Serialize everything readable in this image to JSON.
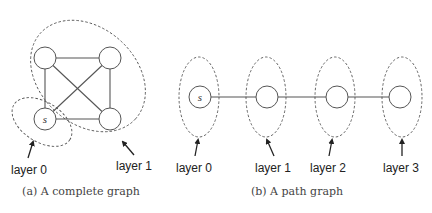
{
  "figures": [
    {
      "id": "a",
      "caption": "(a) A complete graph",
      "type": "complete graph",
      "nodes": [
        {
          "id": "tl",
          "label": ""
        },
        {
          "id": "tr",
          "label": ""
        },
        {
          "id": "bl",
          "label": "s"
        },
        {
          "id": "br",
          "label": ""
        }
      ],
      "edges": [
        [
          "tl",
          "tr"
        ],
        [
          "tl",
          "bl"
        ],
        [
          "tl",
          "br"
        ],
        [
          "tr",
          "bl"
        ],
        [
          "tr",
          "br"
        ],
        [
          "bl",
          "br"
        ]
      ],
      "layers": [
        {
          "label": "layer 0",
          "nodes": [
            "bl"
          ]
        },
        {
          "label": "layer 1",
          "nodes": [
            "tl",
            "tr",
            "br"
          ]
        }
      ]
    },
    {
      "id": "b",
      "caption": "(b) A path graph",
      "type": "path graph",
      "nodes": [
        {
          "id": "n0",
          "label": "s"
        },
        {
          "id": "n1",
          "label": ""
        },
        {
          "id": "n2",
          "label": ""
        },
        {
          "id": "n3",
          "label": ""
        }
      ],
      "edges": [
        [
          "n0",
          "n1"
        ],
        [
          "n1",
          "n2"
        ],
        [
          "n2",
          "n3"
        ]
      ],
      "layers": [
        {
          "label": "layer 0",
          "nodes": [
            "n0"
          ]
        },
        {
          "label": "layer 1",
          "nodes": [
            "n1"
          ]
        },
        {
          "label": "layer 2",
          "nodes": [
            "n2"
          ]
        },
        {
          "label": "layer 3",
          "nodes": [
            "n3"
          ]
        }
      ]
    }
  ]
}
